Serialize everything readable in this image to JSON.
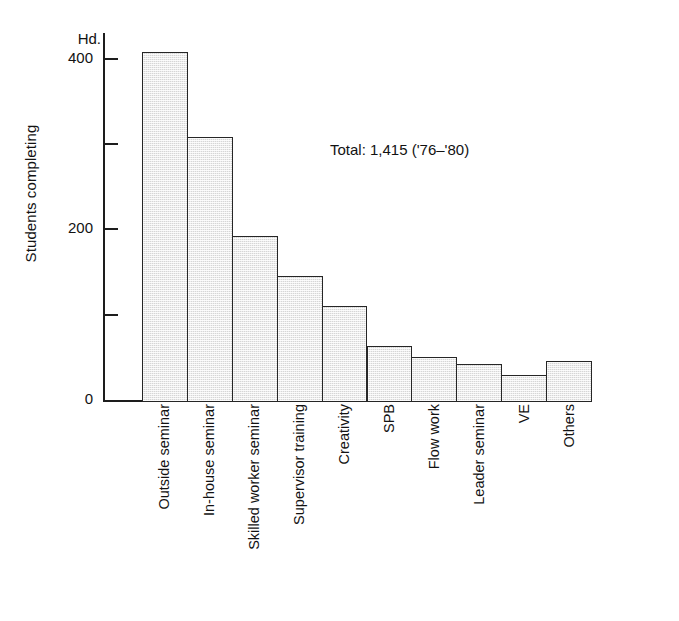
{
  "chart_data": {
    "type": "bar",
    "title": "",
    "xlabel": "",
    "ylabel": "Students completing",
    "y_unit": "Hd.",
    "ylim": [
      0,
      430
    ],
    "grid": false,
    "legend": null,
    "annotation": "Total: 1,415 ('76–'80)",
    "y_ticks": [
      {
        "value": 0,
        "label": "0",
        "labeled": true
      },
      {
        "value": 100,
        "label": "",
        "labeled": false
      },
      {
        "value": 200,
        "label": "200",
        "labeled": true
      },
      {
        "value": 300,
        "label": "",
        "labeled": false
      },
      {
        "value": 400,
        "label": "400",
        "labeled": true
      }
    ],
    "categories": [
      "Outside seminar",
      "In-house seminar",
      "Skilled worker seminar",
      "Supervisor training",
      "Creativity",
      "SPB",
      "Flow work",
      "Leader seminar",
      "VE",
      "Others"
    ],
    "values": [
      410,
      310,
      194,
      148,
      112,
      66,
      53,
      45,
      32,
      48
    ],
    "bar_fill_color": "#d6d6d6",
    "bar_border_color": "#262626",
    "axis_color": "#1d1d1d",
    "text_color": "#121212",
    "background_color": "#ffffff"
  }
}
